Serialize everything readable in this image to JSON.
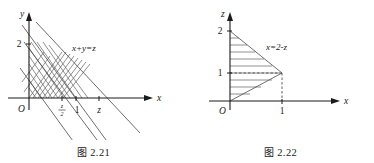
{
  "figures": [
    {
      "id": "fig-2-21",
      "caption_cjk": "图",
      "caption_number": "2.21",
      "axes": {
        "x_label": "x",
        "y_label": "y",
        "origin_label": "O"
      },
      "y_ticks": [
        {
          "label": "2",
          "value": 2
        }
      ],
      "x_ticks": [
        {
          "label": "z/2",
          "numerator": "z",
          "denominator": "2",
          "value": 0.5
        },
        {
          "label": "1",
          "value": 1
        },
        {
          "label": "z",
          "value": 1.5
        }
      ],
      "curve_label": "x+y=z",
      "region_note": "cross-hatched triangular region bounded by x+y=z, x=y and the axes",
      "lines": [
        {
          "name": "line-x-plus-y-equals-2",
          "equation": "x+y=2"
        },
        {
          "name": "line-x-plus-y-equals-z",
          "equation": "x+y=z"
        },
        {
          "name": "line-x-plus-y-equals-1",
          "equation": "x+y=1"
        }
      ]
    },
    {
      "id": "fig-2-22",
      "caption_cjk": "图",
      "caption_number": "2.22",
      "axes": {
        "x_label": "x",
        "z_label": "z",
        "origin_label": "O"
      },
      "z_ticks": [
        {
          "label": "2",
          "value": 2
        },
        {
          "label": "1",
          "value": 1
        }
      ],
      "x_ticks": [
        {
          "label": "1",
          "value": 1
        }
      ],
      "curve_label": "x=2-z",
      "region_note": "hatched region bounded by z=x, x=2-z and the z-axis",
      "vertex": {
        "x": 1,
        "z": 1
      }
    }
  ]
}
